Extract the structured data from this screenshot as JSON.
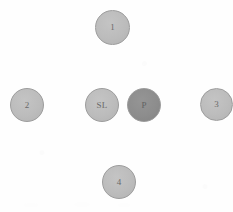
{
  "diagram": {
    "background_color": "#fefefe",
    "node_fill_light": "#bcbcbc",
    "node_fill_dark": "#8d8d8d",
    "node_stroke_color": "#9c9c9c",
    "node_text_color": "#5a5a5a",
    "nodes": [
      {
        "id": "node-1",
        "label": "1",
        "x": 95,
        "y": 10,
        "size": 35,
        "font_size": 9,
        "fill": "#bcbcbc",
        "variant": "light"
      },
      {
        "id": "node-2",
        "label": "2",
        "x": 10,
        "y": 88,
        "size": 34,
        "font_size": 9,
        "fill": "#bcbcbc",
        "variant": "light"
      },
      {
        "id": "node-sl",
        "label": "SL",
        "x": 85,
        "y": 88,
        "size": 34,
        "font_size": 9,
        "fill": "#bcbcbc",
        "variant": "light"
      },
      {
        "id": "node-p",
        "label": "P",
        "x": 127,
        "y": 88,
        "size": 34,
        "font_size": 9,
        "fill": "#8d8d8d",
        "variant": "dark"
      },
      {
        "id": "node-3",
        "label": "3",
        "x": 200,
        "y": 88,
        "size": 33,
        "font_size": 9,
        "fill": "#bcbcbc",
        "variant": "light"
      },
      {
        "id": "node-4",
        "label": "4",
        "x": 102,
        "y": 165,
        "size": 34,
        "font_size": 9,
        "fill": "#bcbcbc",
        "variant": "light"
      }
    ]
  }
}
